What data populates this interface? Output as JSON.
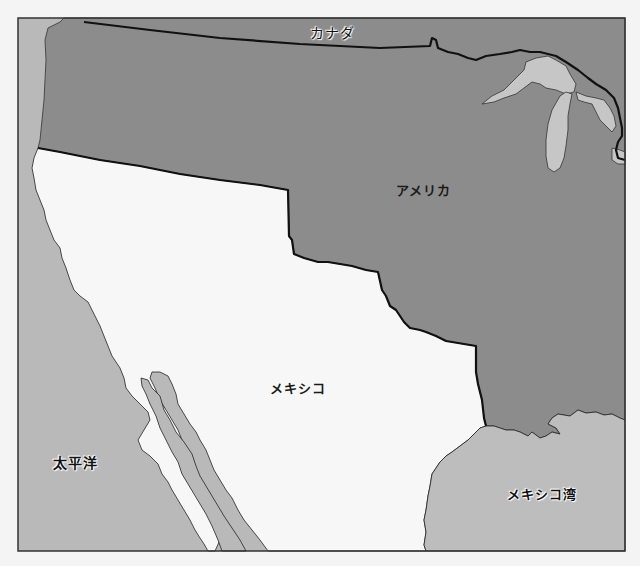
{
  "map": {
    "colors": {
      "background": "#f4f4f4",
      "ocean": "#b9b9b9",
      "usa": "#8c8c8c",
      "canada": "#8c8c8c",
      "mexico": "#f7f7f7",
      "lakes": "#c6c6c6",
      "border": "#111111",
      "frame": "#333333"
    },
    "labels": {
      "canada": "カナダ",
      "usa": "アメリカ",
      "mexico": "メキシコ",
      "pacific": "太平洋",
      "gulf": "メキシコ湾"
    }
  }
}
